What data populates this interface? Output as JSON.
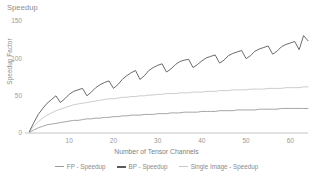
{
  "chart_data": {
    "type": "line",
    "title": "Speedup",
    "xlabel": "Number of Tensor Channels",
    "ylabel": "Speedup Factor",
    "xlim": [
      0,
      64
    ],
    "ylim": [
      0,
      160
    ],
    "xticks": [
      10,
      20,
      30,
      40,
      50,
      60
    ],
    "yticks": [
      0,
      50,
      100,
      150
    ],
    "grid": false,
    "legend_position": "bottom",
    "x": [
      1,
      2,
      3,
      4,
      5,
      6,
      7,
      8,
      9,
      10,
      11,
      12,
      13,
      14,
      15,
      16,
      17,
      18,
      19,
      20,
      21,
      22,
      23,
      24,
      25,
      26,
      27,
      28,
      29,
      30,
      31,
      32,
      33,
      34,
      35,
      36,
      37,
      38,
      39,
      40,
      41,
      42,
      43,
      44,
      45,
      46,
      47,
      48,
      49,
      50,
      51,
      52,
      53,
      54,
      55,
      56,
      57,
      58,
      59,
      60,
      61,
      62,
      63,
      64
    ],
    "series": [
      {
        "name": "BP - Speedup",
        "color": "#5a5a5a",
        "width": 0.9,
        "values": [
          2,
          14,
          25,
          33,
          40,
          45,
          50,
          41,
          46,
          52,
          56,
          58,
          60,
          50,
          55,
          61,
          65,
          68,
          70,
          60,
          65,
          72,
          77,
          81,
          84,
          72,
          77,
          84,
          88,
          91,
          93,
          82,
          86,
          92,
          96,
          98,
          99,
          88,
          92,
          97,
          101,
          103,
          105,
          94,
          98,
          104,
          107,
          109,
          111,
          100,
          104,
          110,
          113,
          115,
          117,
          106,
          110,
          116,
          119,
          121,
          123,
          112,
          131,
          124
        ]
      },
      {
        "name": "Single Image - Speedup",
        "color": "#c6c6c6",
        "width": 0.9,
        "values": [
          2,
          9,
          15,
          20,
          24,
          27,
          30,
          32,
          34,
          36,
          38,
          39,
          40,
          41,
          42,
          43,
          44,
          45,
          46,
          46,
          47,
          48,
          48,
          49,
          49,
          50,
          50,
          51,
          51,
          52,
          52,
          53,
          53,
          53,
          54,
          54,
          54,
          55,
          55,
          55,
          56,
          56,
          56,
          57,
          57,
          57,
          58,
          58,
          58,
          58,
          59,
          59,
          59,
          59,
          60,
          60,
          60,
          60,
          61,
          61,
          61,
          61,
          62,
          62
        ]
      },
      {
        "name": "FP - Speedup",
        "color": "#9b9b9b",
        "width": 0.9,
        "values": [
          1,
          4,
          7,
          9,
          11,
          12,
          13,
          14,
          15,
          16,
          17,
          17,
          18,
          19,
          19,
          20,
          20,
          21,
          21,
          22,
          22,
          23,
          23,
          24,
          24,
          24,
          25,
          25,
          25,
          26,
          26,
          26,
          27,
          27,
          27,
          28,
          28,
          28,
          28,
          29,
          29,
          29,
          29,
          30,
          30,
          30,
          30,
          31,
          31,
          31,
          31,
          31,
          32,
          32,
          32,
          32,
          32,
          33,
          33,
          33,
          33,
          33,
          33,
          33
        ]
      }
    ]
  },
  "legend": {
    "items": [
      {
        "label": "FP - Speedup",
        "color": "#9b9b9b"
      },
      {
        "label": "BP - Speedup",
        "color": "#5a5a5a"
      },
      {
        "label": "Single Image - Speedup",
        "color": "#c6c6c6"
      }
    ]
  },
  "axis_color": "#b4b4b4"
}
